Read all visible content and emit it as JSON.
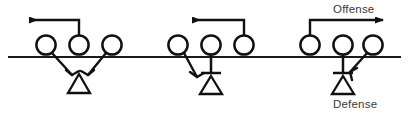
{
  "diagram": {
    "colors": {
      "ink": "#111111",
      "line": "#1a1a1a",
      "text": "#3a3a3a",
      "background": "#ffffff"
    },
    "labels": {
      "offense": "Offense",
      "defense": "Defense"
    },
    "scrimmage_line": {
      "name": "line-of-scrimmage",
      "x1": 8,
      "x2": 401,
      "y": 57
    },
    "groups": [
      {
        "id": "left-group",
        "name": "blocking-scheme-left",
        "players": [
          {
            "id": "L1",
            "role": "offensive-lineman",
            "cx": 46,
            "cy": 45,
            "r": 10
          },
          {
            "id": "L2",
            "role": "offensive-lineman",
            "cx": 79,
            "cy": 45,
            "r": 10
          },
          {
            "id": "L3",
            "role": "offensive-lineman",
            "cx": 112,
            "cy": 45,
            "r": 10
          }
        ],
        "defenders": [
          {
            "id": "LD1",
            "role": "defensive-lineman",
            "cx": 79,
            "cy": 84,
            "size": 11
          }
        ],
        "blocks": [
          {
            "from": "L1",
            "to_x": 72,
            "to_y": 75,
            "type": "shield-block-arrow",
            "direction": "down-right"
          },
          {
            "from": "L3",
            "to_x": 88,
            "to_y": 75,
            "type": "shield-block-arrow",
            "direction": "down-left"
          }
        ],
        "motion": {
          "type": "pull-arrow",
          "from_player": "L2",
          "direction": "left",
          "stem_y": 20,
          "tip_x": 22
        }
      },
      {
        "id": "middle-group",
        "name": "blocking-scheme-middle",
        "players": [
          {
            "id": "M1",
            "role": "offensive-lineman",
            "cx": 178,
            "cy": 45,
            "r": 10
          },
          {
            "id": "M2",
            "role": "offensive-lineman",
            "cx": 211,
            "cy": 45,
            "r": 10
          },
          {
            "id": "M3",
            "role": "offensive-lineman",
            "cx": 244,
            "cy": 45,
            "r": 10
          }
        ],
        "defenders": [
          {
            "id": "MD1",
            "role": "defensive-lineman",
            "cx": 211,
            "cy": 84,
            "size": 11
          }
        ],
        "blocks": [
          {
            "from": "M1",
            "to_x": 196,
            "to_y": 77,
            "type": "shield-block-arrow",
            "direction": "down-right"
          },
          {
            "from": "M2",
            "to_x": 211,
            "to_y": 73,
            "type": "drive-block-bar",
            "direction": "down"
          }
        ],
        "motion": {
          "type": "pull-arrow",
          "from_player": "M3",
          "direction": "left",
          "stem_y": 20,
          "tip_x": 185
        }
      },
      {
        "id": "right-group",
        "name": "blocking-scheme-right",
        "players": [
          {
            "id": "R1",
            "role": "offensive-lineman",
            "cx": 310,
            "cy": 45,
            "r": 10
          },
          {
            "id": "R2",
            "role": "offensive-lineman",
            "cx": 343,
            "cy": 45,
            "r": 10
          },
          {
            "id": "R3",
            "role": "offensive-lineman",
            "cx": 373,
            "cy": 45,
            "r": 10
          }
        ],
        "defenders": [
          {
            "id": "RD1",
            "role": "defensive-lineman",
            "cx": 343,
            "cy": 84,
            "size": 11
          }
        ],
        "blocks": [
          {
            "from": "R2",
            "to_x": 343,
            "to_y": 73,
            "type": "drive-block-bar",
            "direction": "down"
          },
          {
            "from": "R3",
            "to_x": 352,
            "to_y": 72,
            "type": "shield-block-arrow",
            "direction": "down-left"
          }
        ],
        "motion": {
          "type": "pull-arrow",
          "from_player": "R1",
          "direction": "right",
          "stem_y": 20,
          "tip_x": 390
        }
      }
    ]
  }
}
